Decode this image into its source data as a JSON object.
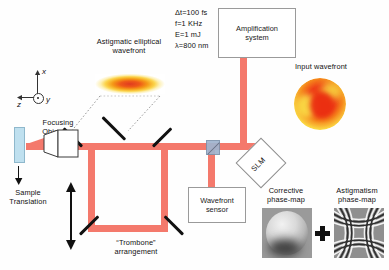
{
  "diagram": {
    "beam_color": "#f4796c",
    "sample_color": "#bfe0ef",
    "beamsplitter_color": "#9fb4cf"
  },
  "laser_params": {
    "pulse_duration": "Δt=100 fs",
    "repetition_rate": "f=1 KHz",
    "pulse_energy": "E=1 mJ",
    "wavelength": "λ=800 nm"
  },
  "boxes": {
    "amplification_system": "Amplification\nsystem",
    "wavefront_sensor": "Wavefront\nsensor",
    "slm": "SLM"
  },
  "labels": {
    "astigmatic_wavefront": "Astigmatic elliptical\nwavefront",
    "input_wavefront": "Input wavefront",
    "focusing_objective": "Focusing\nObjective",
    "sample_translation": "Sample\nTranslation",
    "trombone": "“Trombone”\narrangement",
    "corrective_phase_map": "Corrective\nphase-map",
    "astigmatism_phase_map": "Astigmatism\nphase-map",
    "plus_sign": "+"
  },
  "axes": {
    "x": "x",
    "y": "y",
    "z": "z"
  }
}
